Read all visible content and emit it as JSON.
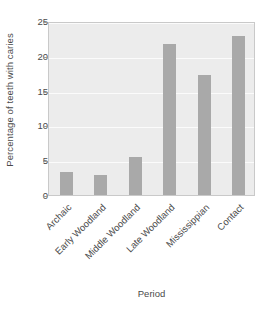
{
  "chart_data": {
    "type": "bar",
    "title": "",
    "subtitle": "",
    "xlabel": "Period",
    "ylabel": "Percentage of teeth with caries",
    "categories": [
      "Archaic",
      "Early Woodland",
      "Middle Woodland",
      "Late Woodland",
      "Mississippian",
      "Contact"
    ],
    "values": [
      3.3,
      2.9,
      5.5,
      21.7,
      17.3,
      22.8
    ],
    "ylim": [
      0,
      25
    ],
    "yticks": [
      0,
      5,
      10,
      15,
      20,
      25
    ],
    "ytick_labels": [
      "0",
      "5",
      "10",
      "15",
      "20",
      "25"
    ],
    "grid": true,
    "grid_axis": "y",
    "legend": false,
    "legend_position": "none",
    "bar_color": "#a9a9a9",
    "plot_background": "#ececec",
    "gridline_color": "#fbfbfb",
    "figure_background": "#ffffff",
    "xtick_label_rotation": -45
  }
}
